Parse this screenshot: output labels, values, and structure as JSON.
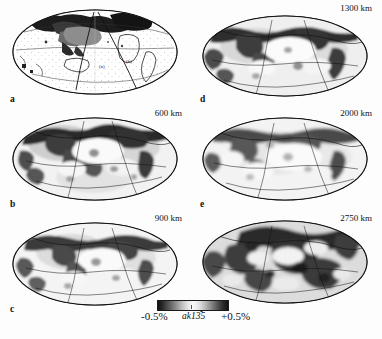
{
  "figure": {
    "type": "seismic-tomography-map-grid",
    "projection": "Mollweide",
    "rows": 3,
    "columns": 2
  },
  "panels": [
    {
      "letter": "a",
      "depth_label": "",
      "position": "top-left",
      "annotations": [
        {
          "text": "(a)",
          "x": 97,
          "y": 62
        },
        {
          "text": "(b)",
          "x": 124,
          "y": 57
        }
      ]
    },
    {
      "letter": "b",
      "depth_label": "600 km",
      "position": "middle-left",
      "annotations": []
    },
    {
      "letter": "c",
      "depth_label": "900 km",
      "position": "bottom-left",
      "annotations": []
    },
    {
      "letter": "d",
      "depth_label": "1300 km",
      "position": "top-right",
      "annotations": []
    },
    {
      "letter": "e",
      "depth_label": "2000 km",
      "position": "middle-right",
      "annotations": []
    },
    {
      "letter": "f",
      "depth_label": "2750 km",
      "position": "bottom-right",
      "annotations": []
    }
  ],
  "colorbar": {
    "min_label": "-0.5%",
    "max_label": "+0.5%",
    "model_label": "ak135",
    "scale": "grayscale-diverging",
    "low_color": "#111111",
    "mid_color": "#fbfbfb",
    "high_color": "#111111"
  }
}
